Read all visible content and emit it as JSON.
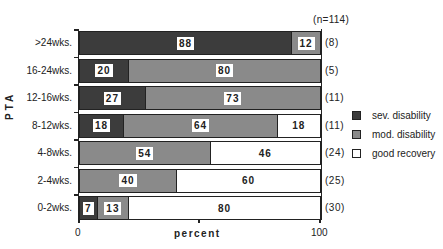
{
  "chart_data": {
    "type": "bar",
    "orientation": "horizontal",
    "stacked": true,
    "title": "",
    "annotation": "(n=114)",
    "xlabel": "percent",
    "ylabel": "PTA",
    "xlim": [
      0,
      100
    ],
    "x_tick_labels": [
      "0",
      "100"
    ],
    "grid": false,
    "legend_position": "right",
    "categories": [
      ">24wks.",
      "16-24wks.",
      "12-16wks.",
      "8-12wks.",
      "4-8wks.",
      "2-4wks.",
      "0-2wks."
    ],
    "counts": [
      "(8)",
      "(5)",
      "(11)",
      "(11)",
      "(24)",
      "(25)",
      "(30)"
    ],
    "series": [
      {
        "name": "sev. disability",
        "key": "sev",
        "values": [
          88,
          20,
          27,
          18,
          0,
          0,
          7
        ]
      },
      {
        "name": "mod. disability",
        "key": "mod",
        "values": [
          12,
          80,
          73,
          64,
          54,
          40,
          13
        ]
      },
      {
        "name": "good recovery",
        "key": "good",
        "values": [
          0,
          0,
          0,
          18,
          46,
          60,
          80
        ]
      }
    ]
  },
  "colors": {
    "sev": "#5a5a5a",
    "mod": "#a4a4a4",
    "good": "#ffffff",
    "outline": "#222222"
  }
}
